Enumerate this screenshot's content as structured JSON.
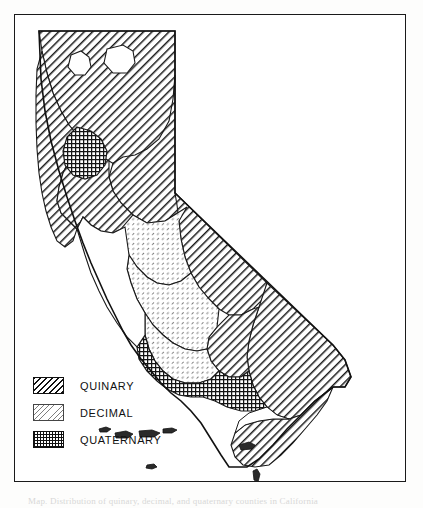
{
  "figure": {
    "caption_clipped": "Map. Distribution of quinary, decimal, and quaternary counties in California"
  },
  "legend": {
    "items": [
      {
        "label": "Quinary",
        "pattern": "diagonal-hatch"
      },
      {
        "label": "Decimal",
        "pattern": "light-stipple"
      },
      {
        "label": "Quaternary",
        "pattern": "cross-hatch"
      }
    ]
  },
  "colors": {
    "ink": "#111111",
    "paper": "#ffffff",
    "page": "#fdfdfc",
    "frame": "#1a1a1a"
  },
  "map_data": {
    "type": "choropleth",
    "region": "California",
    "categories": [
      "Quinary",
      "Decimal",
      "Quaternary",
      "Unshaded"
    ],
    "regions": [
      {
        "name": "north-coast-block",
        "category": "Quinary"
      },
      {
        "name": "far-north-block",
        "category": "Quinary"
      },
      {
        "name": "northeast-block",
        "category": "Quinary"
      },
      {
        "name": "sacramento-valley-white-a",
        "category": "Unshaded"
      },
      {
        "name": "sacramento-valley-white-b",
        "category": "Unshaded"
      },
      {
        "name": "bay-area-core",
        "category": "Quaternary"
      },
      {
        "name": "sierra-block",
        "category": "Quinary"
      },
      {
        "name": "central-coast-white",
        "category": "Unshaded"
      },
      {
        "name": "san-joaquin-valley",
        "category": "Decimal"
      },
      {
        "name": "southern-sierra",
        "category": "Decimal"
      },
      {
        "name": "south-coast-block",
        "category": "Quaternary"
      },
      {
        "name": "inland-desert-block",
        "category": "Quinary"
      },
      {
        "name": "southeast-desert-block",
        "category": "Quinary"
      },
      {
        "name": "channel-islands",
        "category": "Unshaded"
      }
    ]
  }
}
